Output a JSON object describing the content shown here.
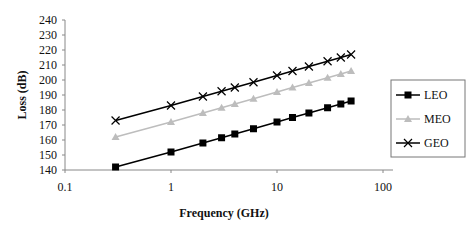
{
  "chart_data": {
    "type": "line",
    "title": "",
    "xlabel": "Frequency (GHz)",
    "ylabel": "Loss (dB)",
    "xscale": "log",
    "xlim": [
      0.1,
      100
    ],
    "ylim": [
      140,
      240
    ],
    "x_ticks": [
      "0.1",
      "1",
      "10",
      "100"
    ],
    "y_ticks": [
      "140",
      "150",
      "160",
      "170",
      "180",
      "190",
      "200",
      "210",
      "220",
      "230",
      "240"
    ],
    "grid": false,
    "legend_position": "right",
    "x": [
      0.3,
      1,
      2,
      3,
      4,
      6,
      10,
      14,
      20,
      30,
      40,
      50
    ],
    "series": [
      {
        "name": "LEO",
        "marker": "square",
        "color": "#000000",
        "values": [
          142,
          152,
          158,
          161.5,
          164,
          167.5,
          172,
          175,
          178,
          181.5,
          184,
          186
        ]
      },
      {
        "name": "MEO",
        "marker": "triangle",
        "color": "#bdbdbd",
        "values": [
          162,
          172,
          178,
          181.5,
          184,
          187.5,
          192,
          195,
          198,
          201.5,
          204,
          206
        ]
      },
      {
        "name": "GEO",
        "marker": "x",
        "color": "#000000",
        "values": [
          173,
          183,
          189,
          192.5,
          195,
          198.5,
          203,
          206,
          209,
          212.5,
          215,
          217
        ]
      }
    ]
  }
}
